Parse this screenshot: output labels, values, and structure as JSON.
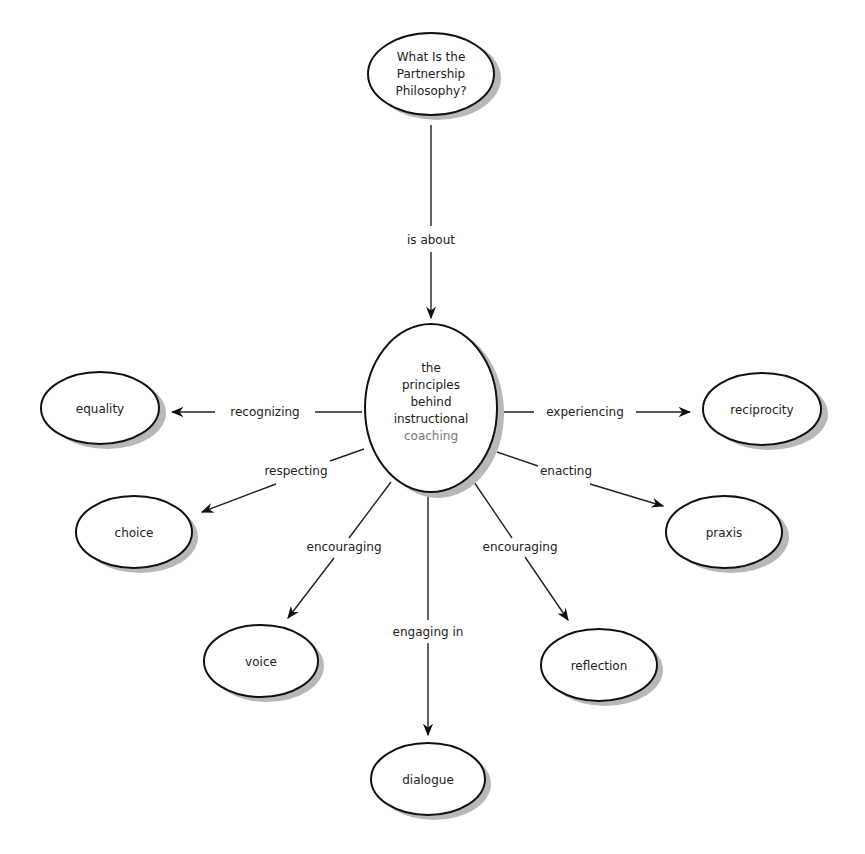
{
  "diagram": {
    "type": "concept-map",
    "nodes": {
      "root": {
        "lines": [
          "What Is the",
          "Partnership",
          "Philosophy?"
        ]
      },
      "center": {
        "lines": [
          "the",
          "principles",
          "behind",
          "instructional",
          "coaching"
        ]
      },
      "equality": {
        "label": "equality"
      },
      "reciprocity": {
        "label": "reciprocity"
      },
      "choice": {
        "label": "choice"
      },
      "praxis": {
        "label": "praxis"
      },
      "voice": {
        "label": "voice"
      },
      "reflection": {
        "label": "reflection"
      },
      "dialogue": {
        "label": "dialogue"
      }
    },
    "edges": {
      "root_center": "is about",
      "center_equality": "recognizing",
      "center_reciprocity": "experiencing",
      "center_choice": "respecting",
      "center_praxis": "enacting",
      "center_voice": "encouraging",
      "center_reflection": "encouraging",
      "center_dialogue": "engaging in"
    }
  }
}
